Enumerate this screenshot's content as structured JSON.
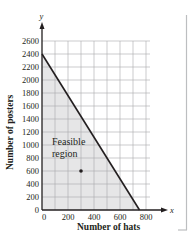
{
  "chart_data": {
    "type": "area",
    "title": "",
    "xlabel": "Number of hats",
    "ylabel": "Number of posters",
    "x_axis_var": "x",
    "y_axis_var": "y",
    "xlim": [
      0,
      800
    ],
    "ylim": [
      0,
      2600
    ],
    "x_ticks": [
      0,
      200,
      400,
      600,
      800
    ],
    "y_ticks": [
      0,
      200,
      400,
      600,
      800,
      1000,
      1200,
      1400,
      1600,
      1800,
      2000,
      2200,
      2400,
      2600
    ],
    "grid": true,
    "grid_x_step": 100,
    "grid_y_step": 200,
    "series": [
      {
        "name": "Constraint boundary",
        "type": "line",
        "x": [
          0,
          750
        ],
        "y": [
          2400,
          0
        ]
      }
    ],
    "shaded_region": {
      "label": "Feasible region",
      "vertices": [
        [
          0,
          0
        ],
        [
          0,
          2400
        ],
        [
          750,
          0
        ]
      ],
      "color": "#e6e6e7"
    },
    "points": [
      {
        "x": 300,
        "y": 600
      }
    ],
    "annotations": [
      {
        "text": "Feasible",
        "x": 0,
        "y": 0
      },
      {
        "text": "region",
        "x": 0,
        "y": 0
      }
    ],
    "legend": null
  },
  "labels": {
    "x_axis_title": "Number of hats",
    "y_axis_title": "Number of posters",
    "x_var": "x",
    "y_var": "y",
    "region_line1": "Feasible",
    "region_line2": "region"
  },
  "colors": {
    "axis": "#231f20",
    "grid": "#a7a9ac",
    "shade": "#e6e6e7",
    "boundary": "#231f20",
    "bracket": "#bcbec0"
  }
}
